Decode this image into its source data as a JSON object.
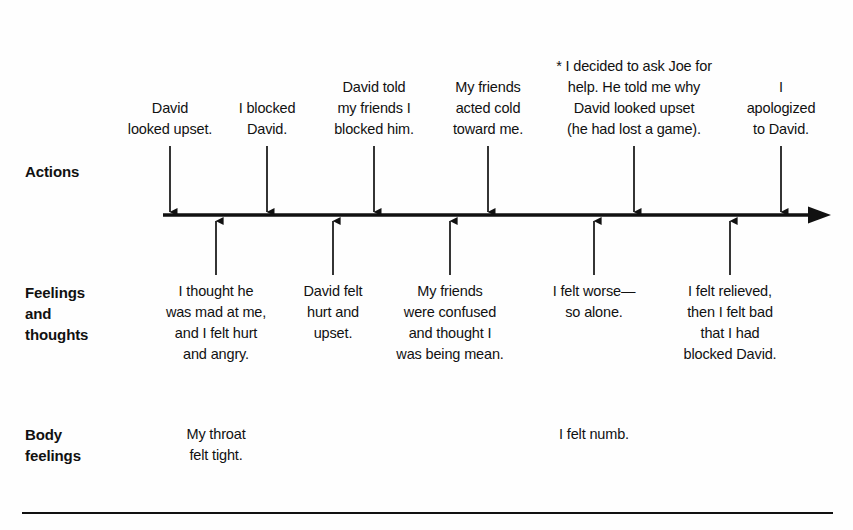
{
  "rows": {
    "actions": {
      "label": "Actions"
    },
    "feelings": {
      "label": "Feelings\nand\nthoughts"
    },
    "body": {
      "label": "Body\nfeelings"
    }
  },
  "timeline": {
    "axis_color": "#111111",
    "direction": "left-to-right",
    "arrowhead": "right"
  },
  "actions": [
    {
      "text": "David\nlooked upset.",
      "x": 170
    },
    {
      "text": "I blocked\nDavid.",
      "x": 267
    },
    {
      "text": "David told\nmy friends I\nblocked him.",
      "x": 374
    },
    {
      "text": "My friends\nacted cold\ntoward me.",
      "x": 488
    },
    {
      "text": "* I decided to ask Joe for\nhelp. He told me why\nDavid looked upset\n(he had lost a game).",
      "x": 634
    },
    {
      "text": "I apologized\nto David.",
      "x": 781
    }
  ],
  "feelings": [
    {
      "text": "I thought he\nwas mad at me,\nand I felt hurt\nand angry.",
      "x": 216
    },
    {
      "text": "David felt\nhurt and\nupset.",
      "x": 333
    },
    {
      "text": "My friends\nwere confused\nand thought I\nwas being mean.",
      "x": 450
    },
    {
      "text": "I felt worse—\nso alone.",
      "x": 594
    },
    {
      "text": "I felt relieved,\nthen I felt bad\nthat I had\nblocked David.",
      "x": 730
    }
  ],
  "body": [
    {
      "text": "My throat\nfelt tight.",
      "x": 216
    },
    {
      "text": "I felt numb.",
      "x": 594
    }
  ]
}
